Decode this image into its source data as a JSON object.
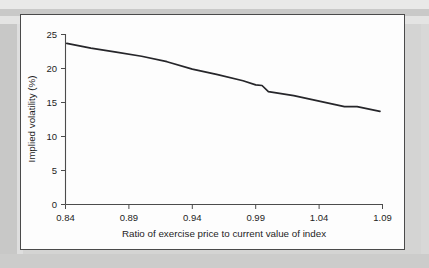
{
  "figure": {
    "background_color": "#fdfdfd",
    "border_color": "#4a4a4a",
    "page_background": "#d4d4d3"
  },
  "chart_data": {
    "type": "line",
    "title": "",
    "subtitle": "",
    "xlabel": "Ratio of exercise price to current value of index",
    "ylabel": "Implied volatility (%)",
    "xlim": [
      0.84,
      1.09
    ],
    "ylim": [
      0,
      25
    ],
    "xticks": [
      0.84,
      0.89,
      0.94,
      0.99,
      1.04,
      1.09
    ],
    "xtick_labels": [
      "0.84",
      "0.89",
      "0.94",
      "0.99",
      "1.04",
      "1.09"
    ],
    "yticks": [
      0,
      5,
      10,
      15,
      20,
      25
    ],
    "ytick_labels": [
      "0",
      "5",
      "10",
      "15",
      "20",
      "25"
    ],
    "grid": false,
    "legend": false,
    "legend_position": "none",
    "line_color": "#26262a",
    "series": [
      {
        "name": "Implied volatility",
        "x": [
          0.841,
          0.86,
          0.88,
          0.9,
          0.92,
          0.94,
          0.96,
          0.98,
          0.99,
          0.995,
          1.0,
          1.02,
          1.04,
          1.06,
          1.07,
          1.088
        ],
        "values": [
          23.7,
          23.0,
          22.4,
          21.8,
          21.0,
          19.9,
          19.1,
          18.2,
          17.6,
          17.5,
          16.6,
          16.0,
          15.2,
          14.4,
          14.4,
          13.7
        ]
      }
    ]
  }
}
